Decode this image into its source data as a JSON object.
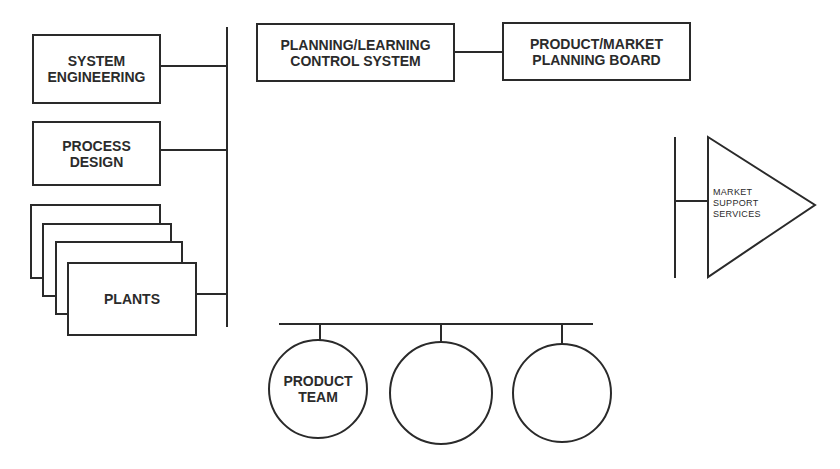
{
  "diagram": {
    "type": "organizational-structure",
    "nodes": {
      "system_engineering": "SYSTEM\nENGINEERING",
      "process_design": "PROCESS\nDESIGN",
      "plants": "PLANTS",
      "planning_learning": "PLANNING/LEARNING\nCONTROL SYSTEM",
      "product_market_board": "PRODUCT/MARKET\nPLANNING BOARD",
      "market_support": "MARKET\nSUPPORT\nSERVICES",
      "product_team": "PRODUCT\nTEAM",
      "team_2": "",
      "team_3": ""
    },
    "edges": [
      [
        "system_engineering",
        "left-bus"
      ],
      [
        "process_design",
        "left-bus"
      ],
      [
        "plants",
        "left-bus"
      ],
      [
        "planning_learning",
        "product_market_board"
      ],
      [
        "market_support",
        "right-bus"
      ],
      [
        "product_team",
        "bottom-bus"
      ],
      [
        "team_2",
        "bottom-bus"
      ],
      [
        "team_3",
        "bottom-bus"
      ]
    ],
    "colors": {
      "stroke": "#2a2a2a",
      "background": "#ffffff"
    }
  }
}
